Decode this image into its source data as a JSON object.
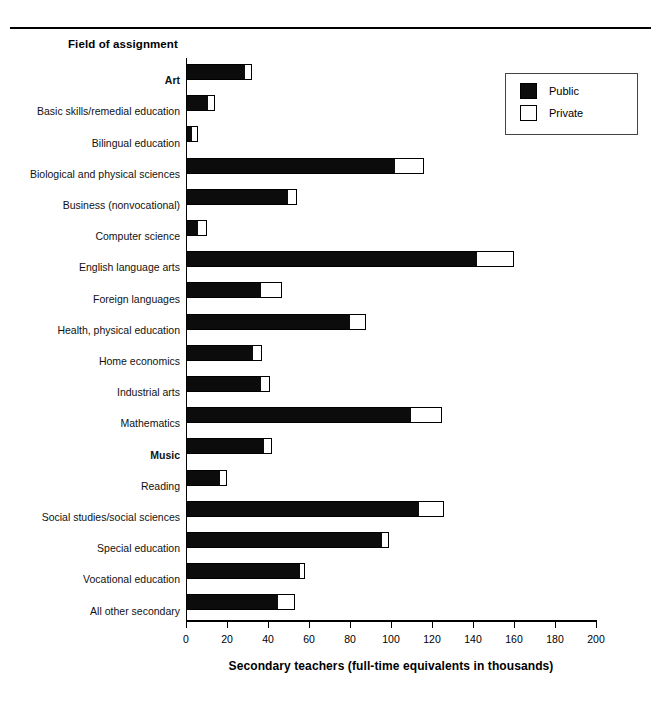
{
  "heading": "Field of assignment",
  "legend": {
    "items": [
      {
        "label": "Public",
        "fill": "#0c0c0c"
      },
      {
        "label": "Private",
        "fill": "#ffffff"
      }
    ]
  },
  "axis": {
    "title": "Secondary teachers (full-time equivalents in thousands)",
    "ticks": [
      "0",
      "20",
      "40",
      "60",
      "80",
      "100",
      "120",
      "140",
      "160",
      "180",
      "200"
    ]
  },
  "chart_data": {
    "type": "bar",
    "orientation": "horizontal",
    "stacked": true,
    "title": "Field of assignment",
    "xlabel": "Secondary teachers (full-time equivalents in thousands)",
    "ylabel": "Field of assignment",
    "xlim": [
      0,
      200
    ],
    "xticks": [
      0,
      20,
      40,
      60,
      80,
      100,
      120,
      140,
      160,
      180,
      200
    ],
    "grid": false,
    "legend_position": "top-right",
    "categories": [
      "Art",
      "Basic skills/remedial education",
      "Bilingual education",
      "Biological and physical sciences",
      "Business (nonvocational)",
      "Computer science",
      "English language arts",
      "Foreign languages",
      "Health, physical education",
      "Home economics",
      "Industrial arts",
      "Mathematics",
      "Music",
      "Reading",
      "Social studies/social sciences",
      "Special education",
      "Vocational education",
      "All other secondary"
    ],
    "bold_categories": [
      "Art",
      "Music"
    ],
    "series": [
      {
        "name": "Public",
        "values": [
          29,
          11,
          3,
          102,
          50,
          6,
          142,
          37,
          80,
          33,
          37,
          110,
          38,
          17,
          114,
          96,
          56,
          45
        ]
      },
      {
        "name": "Private",
        "values": [
          3,
          3,
          3,
          14,
          4,
          4,
          18,
          10,
          8,
          4,
          4,
          15,
          4,
          3,
          12,
          3,
          2,
          8
        ]
      }
    ],
    "totals": [
      32,
      14,
      6,
      116,
      54,
      10,
      160,
      47,
      88,
      37,
      41,
      125,
      42,
      20,
      126,
      99,
      58,
      53
    ]
  },
  "rows": [
    {
      "label": "Art",
      "bold": true,
      "public": 29,
      "total": 32
    },
    {
      "label": "Basic skills/remedial education",
      "bold": false,
      "public": 11,
      "total": 14
    },
    {
      "label": "Bilingual education",
      "bold": false,
      "public": 3,
      "total": 6
    },
    {
      "label": "Biological and physical sciences",
      "bold": false,
      "public": 102,
      "total": 116
    },
    {
      "label": "Business (nonvocational)",
      "bold": false,
      "public": 50,
      "total": 54
    },
    {
      "label": "Computer science",
      "bold": false,
      "public": 6,
      "total": 10
    },
    {
      "label": "English language arts",
      "bold": false,
      "public": 142,
      "total": 160
    },
    {
      "label": "Foreign languages",
      "bold": false,
      "public": 37,
      "total": 47
    },
    {
      "label": "Health, physical education",
      "bold": false,
      "public": 80,
      "total": 88
    },
    {
      "label": "Home economics",
      "bold": false,
      "public": 33,
      "total": 37
    },
    {
      "label": "Industrial arts",
      "bold": false,
      "public": 37,
      "total": 41
    },
    {
      "label": "Mathematics",
      "bold": false,
      "public": 110,
      "total": 125
    },
    {
      "label": "Music",
      "bold": true,
      "public": 38,
      "total": 42
    },
    {
      "label": "Reading",
      "bold": false,
      "public": 17,
      "total": 20
    },
    {
      "label": "Social studies/social sciences",
      "bold": false,
      "public": 114,
      "total": 126
    },
    {
      "label": "Special education",
      "bold": false,
      "public": 96,
      "total": 99
    },
    {
      "label": "Vocational education",
      "bold": false,
      "public": 56,
      "total": 58
    },
    {
      "label": "All other secondary",
      "bold": false,
      "public": 45,
      "total": 53
    }
  ]
}
